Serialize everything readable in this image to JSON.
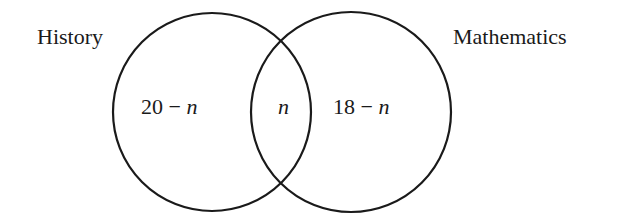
{
  "diagram": {
    "type": "venn",
    "sets": [
      {
        "label": "History",
        "only_region": "20 − n"
      },
      {
        "label": "Mathematics",
        "only_region": "18 − n"
      }
    ],
    "intersection": "n",
    "labels": {
      "history": "History",
      "mathematics": "Mathematics",
      "history_only_num": "20 − ",
      "history_only_var": "n",
      "intersection_var": "n",
      "math_only_num": "18 − ",
      "math_only_var": "n"
    },
    "colors": {
      "stroke": "#1a1a1a",
      "background": "#ffffff"
    }
  }
}
